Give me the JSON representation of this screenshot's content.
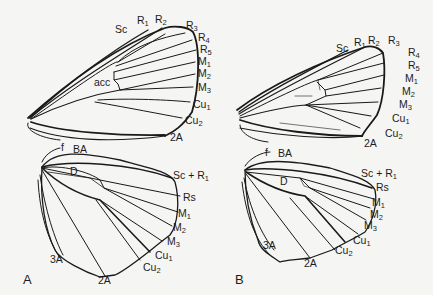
{
  "figure": {
    "panels": [
      {
        "id": "A",
        "label": "A",
        "forewing": {
          "veins": [
            {
              "base": "Sc",
              "sub": ""
            },
            {
              "base": "R",
              "sub": "1"
            },
            {
              "base": "R",
              "sub": "2"
            },
            {
              "base": "R",
              "sub": "3"
            },
            {
              "base": "R",
              "sub": "4"
            },
            {
              "base": "R",
              "sub": "5"
            },
            {
              "base": "M",
              "sub": "1"
            },
            {
              "base": "M",
              "sub": "2"
            },
            {
              "base": "M",
              "sub": "3"
            },
            {
              "base": "Cu",
              "sub": "1"
            },
            {
              "base": "Cu",
              "sub": "2"
            },
            {
              "base": "2A",
              "sub": ""
            }
          ],
          "cell_label": "acc"
        },
        "hindwing": {
          "veins": [
            {
              "base": "f",
              "sub": ""
            },
            {
              "base": "BA",
              "sub": ""
            },
            {
              "base": "D",
              "sub": ""
            },
            {
              "base": "Sc + R",
              "sub": "1"
            },
            {
              "base": "Rs",
              "sub": ""
            },
            {
              "base": "M",
              "sub": "1"
            },
            {
              "base": "M",
              "sub": "2"
            },
            {
              "base": "M",
              "sub": "3"
            },
            {
              "base": "Cu",
              "sub": "1"
            },
            {
              "base": "Cu",
              "sub": "2"
            },
            {
              "base": "2A",
              "sub": ""
            },
            {
              "base": "3A",
              "sub": ""
            }
          ]
        }
      },
      {
        "id": "B",
        "label": "B",
        "forewing": {
          "veins": [
            {
              "base": "Sc",
              "sub": ""
            },
            {
              "base": "R",
              "sub": "1"
            },
            {
              "base": "R",
              "sub": "2"
            },
            {
              "base": "R",
              "sub": "3"
            },
            {
              "base": "R",
              "sub": "4"
            },
            {
              "base": "R",
              "sub": "5"
            },
            {
              "base": "M",
              "sub": "1"
            },
            {
              "base": "M",
              "sub": "2"
            },
            {
              "base": "M",
              "sub": "3"
            },
            {
              "base": "Cu",
              "sub": "1"
            },
            {
              "base": "Cu",
              "sub": "2"
            },
            {
              "base": "2A",
              "sub": ""
            }
          ]
        },
        "hindwing": {
          "veins": [
            {
              "base": "f",
              "sub": ""
            },
            {
              "base": "BA",
              "sub": ""
            },
            {
              "base": "D",
              "sub": ""
            },
            {
              "base": "Sc + R",
              "sub": "1"
            },
            {
              "base": "Rs",
              "sub": ""
            },
            {
              "base": "M",
              "sub": "1"
            },
            {
              "base": "M",
              "sub": "2"
            },
            {
              "base": "M",
              "sub": "3"
            },
            {
              "base": "Cu",
              "sub": "1"
            },
            {
              "base": "Cu",
              "sub": "2"
            },
            {
              "base": "2A",
              "sub": ""
            },
            {
              "base": "3A",
              "sub": ""
            }
          ]
        }
      }
    ]
  }
}
